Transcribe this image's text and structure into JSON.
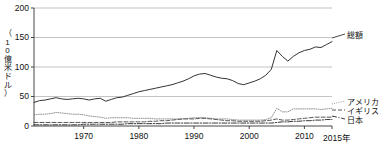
{
  "chart_data": {
    "type": "line",
    "title": "",
    "xlabel": "",
    "ylabel": "（10億米ドル）",
    "ylabel_chars": [
      "（",
      "1",
      "0",
      "億",
      "米",
      "ド",
      "ル",
      "）"
    ],
    "xlim": [
      1961,
      2015
    ],
    "ylim": [
      0,
      200
    ],
    "yticks": [
      0,
      50,
      100,
      150,
      200
    ],
    "ytick_labels": [
      "0",
      "50",
      "100",
      "150",
      "200"
    ],
    "xticks": [
      1970,
      1980,
      1990,
      2000,
      2010,
      2015
    ],
    "xtick_labels": [
      "1970",
      "1980",
      "1990",
      "2000",
      "2010",
      "2015年"
    ],
    "grid": "horizontal",
    "legend_position": "right",
    "x": [
      1961,
      1962,
      1963,
      1964,
      1965,
      1966,
      1967,
      1968,
      1969,
      1970,
      1971,
      1972,
      1973,
      1974,
      1975,
      1976,
      1977,
      1978,
      1979,
      1980,
      1981,
      1982,
      1983,
      1984,
      1985,
      1986,
      1987,
      1988,
      1989,
      1990,
      1991,
      1992,
      1993,
      1994,
      1995,
      1996,
      1997,
      1998,
      1999,
      2000,
      2001,
      2002,
      2003,
      2004,
      2005,
      2006,
      2007,
      2008,
      2009,
      2010,
      2011,
      2012,
      2013,
      2014,
      2015
    ],
    "series": [
      {
        "name": "総額",
        "style": "solid",
        "color": "#333333",
        "values": [
          40,
          43,
          44,
          46,
          48,
          46,
          45,
          46,
          47,
          46,
          44,
          46,
          47,
          42,
          45,
          48,
          49,
          52,
          55,
          58,
          60,
          62,
          64,
          66,
          68,
          70,
          73,
          76,
          80,
          85,
          88,
          89,
          86,
          83,
          81,
          80,
          77,
          72,
          70,
          73,
          76,
          80,
          86,
          96,
          128,
          118,
          110,
          118,
          124,
          128,
          130,
          134,
          133,
          138,
          143
        ]
      },
      {
        "name": "アメリカ",
        "style": "dotted",
        "color": "#888888",
        "values": [
          19,
          20,
          20,
          21,
          23,
          22,
          21,
          20,
          20,
          19,
          17,
          16,
          15,
          13,
          14,
          14,
          14,
          14,
          13,
          13,
          13,
          13,
          12,
          12,
          12,
          12,
          12,
          12,
          13,
          14,
          14,
          14,
          13,
          12,
          12,
          12,
          11,
          10,
          10,
          10,
          10,
          10,
          11,
          14,
          30,
          24,
          24,
          29,
          29,
          29,
          29,
          29,
          28,
          29,
          30
        ]
      },
      {
        "name": "イギリス",
        "style": "dashed",
        "color": "#444444",
        "values": [
          6,
          6,
          6,
          6,
          6,
          6,
          6,
          6,
          6,
          6,
          6,
          6,
          6,
          6,
          6,
          7,
          7,
          7,
          7,
          7,
          7,
          8,
          8,
          9,
          9,
          10,
          11,
          12,
          12,
          12,
          13,
          13,
          12,
          11,
          10,
          9,
          9,
          8,
          8,
          8,
          8,
          8,
          9,
          10,
          12,
          10,
          10,
          11,
          12,
          13,
          14,
          15,
          15,
          15,
          15
        ]
      },
      {
        "name": "日本",
        "style": "dashdot",
        "color": "#222222",
        "values": [
          2,
          2,
          2,
          2,
          2,
          2,
          2,
          2,
          2,
          3,
          3,
          3,
          3,
          3,
          3,
          3,
          3,
          4,
          4,
          4,
          4,
          4,
          4,
          4,
          5,
          5,
          5,
          5,
          5,
          5,
          5,
          5,
          5,
          5,
          5,
          5,
          5,
          5,
          5,
          5,
          5,
          5,
          5,
          5,
          6,
          7,
          7,
          8,
          8,
          9,
          9,
          10,
          10,
          11,
          11
        ]
      }
    ],
    "legend_labels_right_top": [
      "総額"
    ],
    "legend_labels_right_bottom": [
      "アメリカ",
      "イギリス",
      "日本"
    ]
  },
  "axis_colors": {
    "gridline": "#aaaaaa",
    "axis": "#333333",
    "text": "#111111"
  }
}
